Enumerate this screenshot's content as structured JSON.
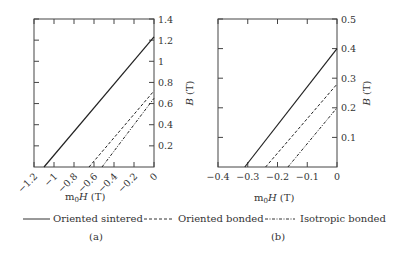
{
  "chart_data": [
    {
      "type": "line",
      "panel_label": "(a)",
      "title": "",
      "xlabel": "m0H (T)",
      "ylabel": "B (T)",
      "xlim": [
        -1.2,
        0
      ],
      "ylim": [
        0,
        1.4
      ],
      "x_ticks": [
        "-1.2",
        "-1",
        "-0.8",
        "-0.6",
        "-0.4",
        "-0.2",
        "0"
      ],
      "y_ticks": [
        "0.2",
        "0.4",
        "0.6",
        "0.8",
        "1",
        "1.2",
        "1.4"
      ],
      "grid": false,
      "series": [
        {
          "name": "Oriented sintered",
          "style": "solid",
          "x": [
            -1.1,
            0
          ],
          "y": [
            0,
            1.23
          ]
        },
        {
          "name": "Oriented bonded",
          "style": "dashed",
          "x": [
            -0.65,
            0
          ],
          "y": [
            0,
            0.72
          ]
        },
        {
          "name": "Isotropic bonded",
          "style": "dashdot",
          "x": [
            -0.52,
            0
          ],
          "y": [
            0,
            0.65
          ]
        }
      ]
    },
    {
      "type": "line",
      "panel_label": "(b)",
      "title": "",
      "xlabel": "m0H (T)",
      "ylabel": "B (T)",
      "xlim": [
        -0.4,
        0
      ],
      "ylim": [
        0,
        0.5
      ],
      "x_ticks": [
        "-0.4",
        "-0.3",
        "-0.2",
        "-0.1",
        "0"
      ],
      "y_ticks": [
        "0.1",
        "0.2",
        "0.3",
        "0.4",
        "0.5"
      ],
      "grid": false,
      "series": [
        {
          "name": "Oriented sintered",
          "style": "solid",
          "x": [
            -0.31,
            0
          ],
          "y": [
            0,
            0.4
          ]
        },
        {
          "name": "Oriented bonded",
          "style": "dashed",
          "x": [
            -0.24,
            0
          ],
          "y": [
            0,
            0.28
          ]
        },
        {
          "name": "Isotropic bonded",
          "style": "dashdot",
          "x": [
            -0.165,
            0
          ],
          "y": [
            0,
            0.2
          ]
        }
      ]
    }
  ],
  "legend": {
    "items": [
      {
        "label": "Oriented sintered",
        "style": "solid"
      },
      {
        "label": "Oriented bonded",
        "style": "dashed"
      },
      {
        "label": "Isotropic bonded",
        "style": "dashdot"
      }
    ]
  },
  "labels": {
    "xlabel_main": "m",
    "xlabel_sub": "0",
    "xlabel_rest_italic": "H",
    "xlabel_unit": " (T)",
    "ylabel_italic": "B",
    "ylabel_unit": " (T)",
    "panel_a": "(a)",
    "panel_b": "(b)"
  }
}
